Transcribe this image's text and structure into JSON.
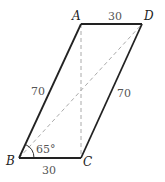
{
  "diagram": {
    "type": "parallelogram",
    "vertices": {
      "A": {
        "label": "A",
        "x": 81,
        "y": 24
      },
      "B": {
        "label": "B",
        "x": 19,
        "y": 158
      },
      "C": {
        "label": "C",
        "x": 81,
        "y": 158
      },
      "D": {
        "label": "D",
        "x": 142,
        "y": 24
      }
    },
    "sides": {
      "AD": "30",
      "BC": "30",
      "AB": "70",
      "CD": "70"
    },
    "angle_B": "65°",
    "dashed_lines": [
      "AC",
      "BD"
    ],
    "colors": {
      "solid_line": "#222222",
      "dashed_line": "#aaaaaa"
    }
  }
}
